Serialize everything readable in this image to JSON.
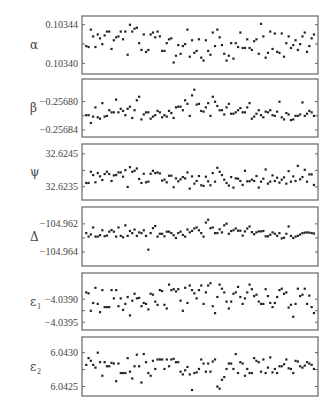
{
  "chart_data": [
    {
      "type": "scatter",
      "symbol": "α",
      "subscript": "",
      "tick_labels": [
        "0.10344",
        "0.10340"
      ],
      "ticks": [
        0.10344,
        0.10342,
        0.1034
      ],
      "ylim": [
        0.103389,
        0.103449
      ],
      "values": [
        0.103418,
        0.103417,
        0.103435,
        0.103428,
        0.103417,
        0.10343,
        0.103426,
        0.10342,
        0.103429,
        0.103433,
        0.103433,
        0.103415,
        0.103424,
        0.103427,
        0.103428,
        0.103433,
        0.103425,
        0.103433,
        0.103409,
        0.10344,
        0.103433,
        0.103436,
        0.103437,
        0.103421,
        0.103414,
        0.10343,
        0.103412,
        0.103414,
        0.10343,
        0.103432,
        0.103427,
        0.103433,
        0.103428,
        0.103413,
        0.103413,
        0.103421,
        0.103425,
        0.103426,
        0.103401,
        0.103408,
        0.103419,
        0.10341,
        0.103418,
        0.10342,
        0.103435,
        0.103407,
        0.103424,
        0.103411,
        0.103413,
        0.103425,
        0.103406,
        0.103403,
        0.103424,
        0.103413,
        0.103409,
        0.103432,
        0.103418,
        0.103435,
        0.103427,
        0.103419,
        0.10341,
        0.103403,
        0.103408,
        0.103421,
        0.103405,
        0.103421,
        0.103417,
        0.103432,
        0.103416,
        0.103416,
        0.103425,
        0.103416,
        0.103414,
        0.103423,
        0.103425,
        0.10341,
        0.103441,
        0.103428,
        0.103406,
        0.103411,
        0.103433,
        0.103415,
        0.103431,
        0.103412,
        0.103411,
        0.103431,
        0.103407,
        0.103421,
        0.103428,
        0.103416,
        0.103419,
        0.103424,
        0.103414,
        0.10342,
        0.103428,
        0.103432,
        0.103412,
        0.103418,
        0.103426,
        0.10343
      ],
      "xlim": [
        0,
        100
      ]
    },
    {
      "type": "scatter",
      "symbol": "β",
      "subscript": "",
      "tick_labels": [
        "−0.25680",
        "−0.25684"
      ],
      "ticks": [
        -0.2568,
        -0.25682,
        -0.25684
      ],
      "ylim": [
        -0.25685,
        -0.256768
      ],
      "values": [
        -0.256819,
        -0.256819,
        -0.25683,
        -0.256821,
        -0.256808,
        -0.256822,
        -0.256824,
        -0.256802,
        -0.256821,
        -0.25682,
        -0.256812,
        -0.256815,
        -0.256815,
        -0.256797,
        -0.256815,
        -0.25681,
        -0.256813,
        -0.256819,
        -0.25681,
        -0.256807,
        -0.256823,
        -0.256812,
        -0.256798,
        -0.256793,
        -0.256825,
        -0.256818,
        -0.256815,
        -0.256815,
        -0.256824,
        -0.256821,
        -0.256819,
        -0.256813,
        -0.256815,
        -0.256822,
        -0.256819,
        -0.256821,
        -0.256813,
        -0.256816,
        -0.256823,
        -0.256808,
        -0.256807,
        -0.256807,
        -0.256812,
        -0.256798,
        -0.256803,
        -0.25682,
        -0.256791,
        -0.256783,
        -0.256804,
        -0.256803,
        -0.256813,
        -0.256814,
        -0.256808,
        -0.256802,
        -0.25682,
        -0.256793,
        -0.2568,
        -0.256806,
        -0.256812,
        -0.256812,
        -0.256818,
        -0.256808,
        -0.256803,
        -0.256817,
        -0.256817,
        -0.256815,
        -0.256812,
        -0.256809,
        -0.256815,
        -0.256815,
        -0.256808,
        -0.256802,
        -0.256824,
        -0.256821,
        -0.256817,
        -0.256812,
        -0.256819,
        -0.256822,
        -0.256814,
        -0.256815,
        -0.256812,
        -0.256819,
        -0.25682,
        -0.256814,
        -0.2568,
        -0.256822,
        -0.256825,
        -0.256816,
        -0.256818,
        -0.256826,
        -0.256825,
        -0.25682,
        -0.25682,
        -0.256818,
        -0.256801,
        -0.25682,
        -0.256817,
        -0.256813,
        -0.256815,
        -0.25682
      ],
      "xlim": [
        0,
        100
      ]
    },
    {
      "type": "scatter",
      "symbol": "ψ",
      "subscript": "",
      "tick_labels": [
        "32.6245",
        "32.6235"
      ],
      "ticks": [
        32.6245,
        32.624,
        32.6235
      ],
      "ylim": [
        32.6231,
        32.6248
      ],
      "values": [
        32.62362,
        32.62362,
        32.62396,
        32.62386,
        32.62364,
        32.62392,
        32.62382,
        32.62371,
        32.62389,
        32.62396,
        32.62389,
        32.62368,
        32.62385,
        32.62386,
        32.62394,
        32.62394,
        32.62381,
        32.62401,
        32.6235,
        32.6241,
        32.62396,
        32.62399,
        32.62406,
        32.62374,
        32.62362,
        32.6239,
        32.62364,
        32.62366,
        32.6239,
        32.62399,
        32.62392,
        32.62394,
        32.62391,
        32.62369,
        32.62372,
        32.62364,
        32.62384,
        32.62384,
        32.62349,
        32.62376,
        32.62367,
        32.62373,
        32.6238,
        32.62376,
        32.62394,
        32.62345,
        32.62382,
        32.6236,
        32.62368,
        32.62383,
        32.62355,
        32.62353,
        32.62381,
        32.62367,
        32.62355,
        32.62392,
        32.62366,
        32.62408,
        32.62396,
        32.62386,
        32.62372,
        32.62362,
        32.62354,
        32.6238,
        32.62348,
        32.62376,
        32.62375,
        32.62368,
        32.62356,
        32.62399,
        32.62367,
        32.62367,
        32.62372,
        32.62368,
        32.62383,
        32.62348,
        32.62366,
        32.62375,
        32.62403,
        32.6236,
        32.62366,
        32.62385,
        32.62368,
        32.62378,
        32.62363,
        32.62372,
        32.62379,
        32.6236,
        32.62398,
        32.62366,
        32.62382,
        32.62368,
        32.62414,
        32.62373,
        32.6238,
        32.62402,
        32.62366,
        32.62388,
        32.62388,
        32.62356
      ],
      "xlim": [
        0,
        100
      ]
    },
    {
      "type": "scatter",
      "symbol": "Δ",
      "subscript": "",
      "tick_labels": [
        "−104.962",
        "−104.964"
      ],
      "ticks": [
        -104.962,
        -104.963,
        -104.964
      ],
      "ylim": [
        -104.965,
        -104.9608
      ],
      "values": [
        -104.96265,
        -104.9629,
        -104.96275,
        -104.96225,
        -104.9629,
        -104.9629,
        -104.9628,
        -104.96245,
        -104.96287,
        -104.96283,
        -104.96255,
        -104.96243,
        -104.96255,
        -104.9629,
        -104.96225,
        -104.96285,
        -104.96295,
        -104.9621,
        -104.96285,
        -104.9625,
        -104.96265,
        -104.9624,
        -104.96285,
        -104.9626,
        -104.96265,
        -104.96245,
        -104.96285,
        -104.96383,
        -104.96265,
        -104.9623,
        -104.96215,
        -104.9629,
        -104.9627,
        -104.9627,
        -104.96288,
        -104.96255,
        -104.96255,
        -104.96265,
        -104.9628,
        -104.963,
        -104.96265,
        -104.96255,
        -104.96278,
        -104.9629,
        -104.9624,
        -104.9626,
        -104.9625,
        -104.96232,
        -104.96225,
        -104.96245,
        -104.96265,
        -104.9629,
        -104.9619,
        -104.9617,
        -104.9623,
        -104.96225,
        -104.96265,
        -104.96265,
        -104.96238,
        -104.9626,
        -104.9621,
        -104.96198,
        -104.9627,
        -104.9625,
        -104.96245,
        -104.96232,
        -104.96248,
        -104.96248,
        -104.96283,
        -104.96253,
        -104.96233,
        -104.96218,
        -104.96258,
        -104.96273,
        -104.9626,
        -104.96253,
        -104.96253,
        -104.9625,
        -104.96288,
        -104.96288,
        -104.96277,
        -104.9626,
        -104.9627,
        -104.96285,
        -104.96265,
        -104.96303,
        -104.96298,
        -104.9627,
        -104.96218,
        -104.96285,
        -104.963,
        -104.9629,
        -104.96285,
        -104.96275,
        -104.96265,
        -104.96262,
        -104.9626,
        -104.96262,
        -104.96265,
        -104.96268
      ],
      "xlim": [
        0,
        100
      ]
    },
    {
      "type": "scatter",
      "symbol": "ε",
      "subscript": "1",
      "tick_labels": [
        "−4.0390",
        "−4.0395"
      ],
      "ticks": [
        -4.039,
        -4.03925,
        -4.0395
      ],
      "ylim": [
        -4.03967,
        -4.03843
      ],
      "values": [
        -4.03885,
        -4.03887,
        -4.03925,
        -4.03908,
        -4.03875,
        -4.0391,
        -4.03928,
        -4.0388,
        -4.03917,
        -4.03917,
        -4.03917,
        -4.0388,
        -4.03898,
        -4.0388,
        -4.03915,
        -4.03898,
        -4.03923,
        -4.0391,
        -4.03895,
        -4.03935,
        -4.03903,
        -4.03888,
        -4.03898,
        -4.03897,
        -4.03915,
        -4.03908,
        -4.0391,
        -4.03922,
        -4.03888,
        -4.0389,
        -4.03905,
        -4.03912,
        -4.0388,
        -4.03882,
        -4.03912,
        -4.0392,
        -4.03868,
        -4.0388,
        -4.03878,
        -4.03883,
        -4.03878,
        -4.03903,
        -4.03925,
        -4.03875,
        -4.03908,
        -4.0387,
        -4.0388,
        -4.03887,
        -4.03898,
        -4.0388,
        -4.0387,
        -4.0391,
        -4.03885,
        -4.0387,
        -4.03865,
        -4.03915,
        -4.0393,
        -4.03895,
        -4.03868,
        -4.03877,
        -4.03885,
        -4.03905,
        -4.0392,
        -4.03905,
        -4.03888,
        -4.03885,
        -4.03873,
        -4.03895,
        -4.0391,
        -4.03898,
        -4.03885,
        -4.03868,
        -4.03878,
        -4.03893,
        -4.0389,
        -4.03905,
        -4.0391,
        -4.0391,
        -4.03878,
        -4.03893,
        -4.03908,
        -4.03917,
        -4.03908,
        -4.03895,
        -4.0388,
        -4.03877,
        -4.03888,
        -4.03885,
        -4.03918,
        -4.03912,
        -4.03938,
        -4.0391,
        -4.03877,
        -4.03893,
        -4.0389,
        -4.03877,
        -4.0391,
        -4.03892,
        -4.03917,
        -4.0393
      ],
      "xlim": [
        0,
        100
      ]
    },
    {
      "type": "scatter",
      "symbol": "ε",
      "subscript": "2",
      "tick_labels": [
        "6.0430",
        "6.0425"
      ],
      "ticks": [
        6.043,
        6.04275,
        6.0425
      ],
      "ylim": [
        6.04236,
        6.04323
      ],
      "values": [
        6.04282,
        6.04292,
        6.04288,
        6.04282,
        6.04278,
        6.043,
        6.04286,
        6.04266,
        6.04286,
        6.0428,
        6.0428,
        6.04285,
        6.04284,
        6.04258,
        6.04284,
        6.0427,
        6.0427,
        6.0427,
        6.04292,
        6.04272,
        6.04262,
        6.0428,
        6.04297,
        6.0428,
        6.04256,
        6.04298,
        6.04286,
        6.0427,
        6.04266,
        6.04288,
        6.04276,
        6.0429,
        6.0429,
        6.0429,
        6.04276,
        6.0429,
        6.0428,
        6.0429,
        6.04291,
        6.04286,
        6.04286,
        6.04272,
        6.04268,
        6.04274,
        6.04279,
        6.04268,
        6.04245,
        6.0427,
        6.04271,
        6.04276,
        6.0429,
        6.04284,
        6.04272,
        6.04284,
        6.04272,
        6.04287,
        6.0429,
        6.0425,
        6.04247,
        6.0426,
        6.04264,
        6.04276,
        6.04284,
        6.04284,
        6.04276,
        6.04298,
        6.0427,
        6.04286,
        6.04284,
        6.04266,
        6.04276,
        6.0427,
        6.0427,
        6.04292,
        6.04288,
        6.04286,
        6.04272,
        6.0429,
        6.0427,
        6.04278,
        6.04293,
        6.04271,
        6.04276,
        6.0427,
        6.0428,
        6.0428,
        6.04283,
        6.0429,
        6.04277,
        6.04276,
        6.0427,
        6.04288,
        6.04287,
        6.0428,
        6.04278,
        6.04281,
        6.04286,
        6.04284,
        6.04282,
        6.04276
      ],
      "xlim": [
        0,
        100
      ]
    }
  ]
}
